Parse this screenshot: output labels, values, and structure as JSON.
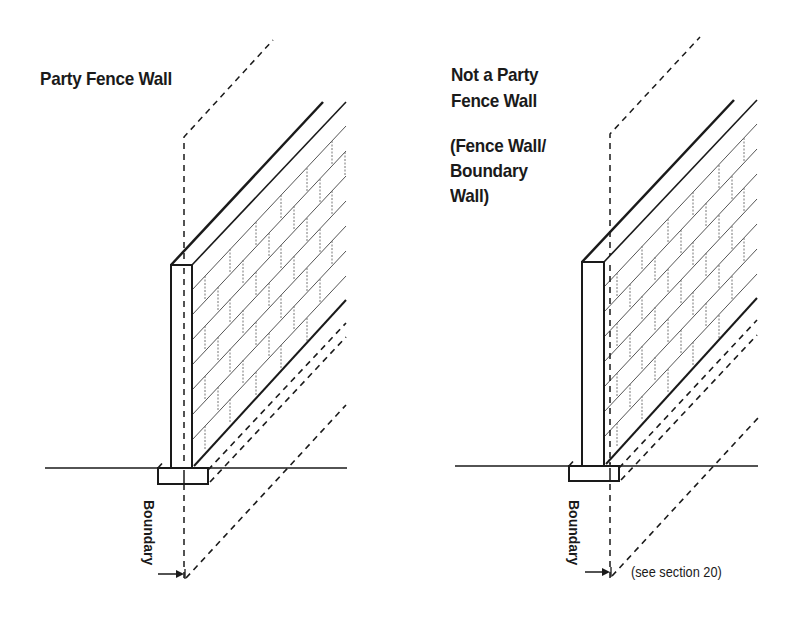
{
  "diagram": {
    "left": {
      "title": "Party Fence Wall",
      "boundary_label": "Boundary"
    },
    "right": {
      "title_line1": "Not a Party",
      "title_line2": "Fence Wall",
      "subtitle_line1": "(Fence Wall/",
      "subtitle_line2": "Boundary",
      "subtitle_line3": "Wall)",
      "boundary_label": "Boundary",
      "note": "(see section 20)"
    },
    "colors": {
      "ink": "#1a1a1a",
      "brick": "#555555",
      "background": "#ffffff"
    }
  }
}
